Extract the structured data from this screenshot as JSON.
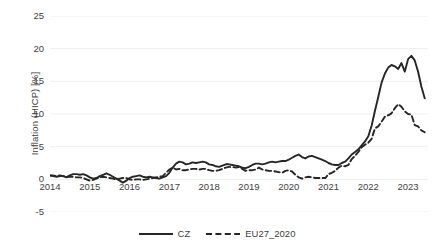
{
  "chart_data": {
    "type": "line",
    "title": "",
    "xlabel": "",
    "ylabel": "Inflation (HICP) [%]",
    "ylim": [
      -5,
      25
    ],
    "ytick_labels": [
      "25",
      "20",
      "15",
      "10",
      "5",
      "0",
      "-5"
    ],
    "ytick_values": [
      25,
      20,
      15,
      10,
      5,
      0,
      -5
    ],
    "xlim": [
      2014.0,
      2023.5
    ],
    "xtick_labels": [
      "2014",
      "2015",
      "2016",
      "2017",
      "2018",
      "2019",
      "2020",
      "2021",
      "2022",
      "2023"
    ],
    "xtick_values": [
      2014,
      2015,
      2016,
      2017,
      2018,
      2019,
      2020,
      2021,
      2022,
      2023
    ],
    "grid": "horizontal",
    "legend_position": "bottom",
    "series": [
      {
        "name": "CZ",
        "style": "solid",
        "color": "#262626",
        "x": [
          2014.0,
          2014.083,
          2014.167,
          2014.25,
          2014.333,
          2014.417,
          2014.5,
          2014.583,
          2014.667,
          2014.75,
          2014.833,
          2014.917,
          2015.0,
          2015.083,
          2015.167,
          2015.25,
          2015.333,
          2015.417,
          2015.5,
          2015.583,
          2015.667,
          2015.75,
          2015.833,
          2015.917,
          2016.0,
          2016.083,
          2016.167,
          2016.25,
          2016.333,
          2016.417,
          2016.5,
          2016.583,
          2016.667,
          2016.75,
          2016.833,
          2016.917,
          2017.0,
          2017.083,
          2017.167,
          2017.25,
          2017.333,
          2017.417,
          2017.5,
          2017.583,
          2017.667,
          2017.75,
          2017.833,
          2017.917,
          2018.0,
          2018.083,
          2018.167,
          2018.25,
          2018.333,
          2018.417,
          2018.5,
          2018.583,
          2018.667,
          2018.75,
          2018.833,
          2018.917,
          2019.0,
          2019.083,
          2019.167,
          2019.25,
          2019.333,
          2019.417,
          2019.5,
          2019.583,
          2019.667,
          2019.75,
          2019.833,
          2019.917,
          2020.0,
          2020.083,
          2020.167,
          2020.25,
          2020.333,
          2020.417,
          2020.5,
          2020.583,
          2020.667,
          2020.75,
          2020.833,
          2020.917,
          2021.0,
          2021.083,
          2021.167,
          2021.25,
          2021.333,
          2021.417,
          2021.5,
          2021.583,
          2021.667,
          2021.75,
          2021.833,
          2021.917,
          2022.0,
          2022.083,
          2022.167,
          2022.25,
          2022.333,
          2022.417,
          2022.5,
          2022.583,
          2022.667,
          2022.75,
          2022.833,
          2022.917,
          2023.0,
          2023.083,
          2023.167,
          2023.25,
          2023.333,
          2023.417
        ],
        "values": [
          0.6,
          0.5,
          0.4,
          0.5,
          0.5,
          0.3,
          0.6,
          0.8,
          0.8,
          0.7,
          0.8,
          0.6,
          0.3,
          0.1,
          0.2,
          0.5,
          0.7,
          0.9,
          0.7,
          0.4,
          0.1,
          -0.2,
          -0.5,
          -0.2,
          0.2,
          0.4,
          0.5,
          0.6,
          0.4,
          0.3,
          0.4,
          0.3,
          0.2,
          0.1,
          0.3,
          0.5,
          1.0,
          1.8,
          2.4,
          2.7,
          2.6,
          2.3,
          2.4,
          2.6,
          2.5,
          2.6,
          2.7,
          2.6,
          2.3,
          2.2,
          2.0,
          1.9,
          2.1,
          2.3,
          2.3,
          2.2,
          2.1,
          2.0,
          1.8,
          1.7,
          1.9,
          2.2,
          2.4,
          2.4,
          2.3,
          2.4,
          2.6,
          2.7,
          2.6,
          2.7,
          2.8,
          2.8,
          3.0,
          3.3,
          3.6,
          3.8,
          3.4,
          3.2,
          3.5,
          3.6,
          3.4,
          3.2,
          3.0,
          2.8,
          2.5,
          2.3,
          2.2,
          2.2,
          2.5,
          2.7,
          3.2,
          3.8,
          4.2,
          4.6,
          5.2,
          5.8,
          6.6,
          8.2,
          10.5,
          12.6,
          14.8,
          16.2,
          17.1,
          17.5,
          17.3,
          16.9,
          17.8,
          16.5,
          18.4,
          18.9,
          18.2,
          16.5,
          14.2,
          12.4
        ]
      },
      {
        "name": "EU27_2020",
        "style": "dashed",
        "color": "#262626",
        "x": [
          2014.0,
          2014.083,
          2014.167,
          2014.25,
          2014.333,
          2014.417,
          2014.5,
          2014.583,
          2014.667,
          2014.75,
          2014.833,
          2014.917,
          2015.0,
          2015.083,
          2015.167,
          2015.25,
          2015.333,
          2015.417,
          2015.5,
          2015.583,
          2015.667,
          2015.75,
          2015.833,
          2015.917,
          2016.0,
          2016.083,
          2016.167,
          2016.25,
          2016.333,
          2016.417,
          2016.5,
          2016.583,
          2016.667,
          2016.75,
          2016.833,
          2016.917,
          2017.0,
          2017.083,
          2017.167,
          2017.25,
          2017.333,
          2017.417,
          2017.5,
          2017.583,
          2017.667,
          2017.75,
          2017.833,
          2017.917,
          2018.0,
          2018.083,
          2018.167,
          2018.25,
          2018.333,
          2018.417,
          2018.5,
          2018.583,
          2018.667,
          2018.75,
          2018.833,
          2018.917,
          2019.0,
          2019.083,
          2019.167,
          2019.25,
          2019.333,
          2019.417,
          2019.5,
          2019.583,
          2019.667,
          2019.75,
          2019.833,
          2019.917,
          2020.0,
          2020.083,
          2020.167,
          2020.25,
          2020.333,
          2020.417,
          2020.5,
          2020.583,
          2020.667,
          2020.75,
          2020.833,
          2020.917,
          2021.0,
          2021.083,
          2021.167,
          2021.25,
          2021.333,
          2021.417,
          2021.5,
          2021.583,
          2021.667,
          2021.75,
          2021.833,
          2021.917,
          2022.0,
          2022.083,
          2022.167,
          2022.25,
          2022.333,
          2022.417,
          2022.5,
          2022.583,
          2022.667,
          2022.75,
          2022.833,
          2022.917,
          2023.0,
          2023.083,
          2023.167,
          2023.25,
          2023.333,
          2023.417
        ],
        "values": [
          0.6,
          0.6,
          0.5,
          0.6,
          0.5,
          0.4,
          0.4,
          0.4,
          0.3,
          0.3,
          0.2,
          0.0,
          -0.2,
          -0.1,
          0.1,
          0.3,
          0.4,
          0.3,
          0.2,
          0.1,
          0.0,
          0.1,
          0.2,
          0.2,
          0.0,
          -0.1,
          0.0,
          0.0,
          -0.1,
          0.0,
          0.1,
          0.2,
          0.3,
          0.4,
          0.5,
          1.0,
          1.5,
          1.8,
          1.5,
          1.6,
          1.4,
          1.4,
          1.5,
          1.6,
          1.6,
          1.5,
          1.6,
          1.6,
          1.4,
          1.3,
          1.3,
          1.4,
          1.6,
          1.8,
          1.9,
          1.9,
          1.8,
          1.9,
          1.6,
          1.3,
          1.4,
          1.4,
          1.5,
          1.8,
          1.5,
          1.4,
          1.3,
          1.3,
          1.2,
          1.1,
          1.0,
          1.3,
          1.4,
          1.2,
          0.7,
          0.3,
          0.1,
          0.3,
          0.4,
          0.3,
          0.2,
          0.2,
          0.2,
          0.2,
          0.8,
          1.0,
          1.3,
          1.8,
          2.1,
          2.0,
          2.2,
          3.1,
          3.6,
          4.2,
          4.9,
          5.3,
          5.6,
          6.2,
          7.8,
          8.1,
          8.8,
          9.6,
          9.8,
          10.1,
          10.9,
          11.5,
          11.1,
          10.4,
          10.0,
          9.9,
          8.3,
          8.1,
          7.5,
          7.2
        ]
      }
    ]
  },
  "legend": {
    "items": [
      {
        "label": "CZ",
        "style": "solid"
      },
      {
        "label": "EU27_2020",
        "style": "dashed"
      }
    ]
  }
}
